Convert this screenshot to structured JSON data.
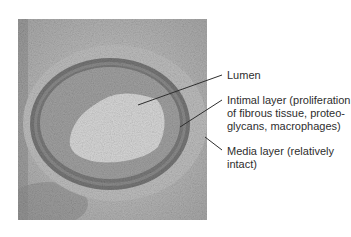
{
  "figure": {
    "type": "histology-micrograph",
    "labels": [
      {
        "id": "lumen",
        "lines": [
          "Lumen"
        ]
      },
      {
        "id": "intimal",
        "lines": [
          "Intimal layer (proliferation",
          "of fibrous tissue, proteo-",
          "glycans, macrophages)"
        ]
      },
      {
        "id": "media",
        "lines": [
          "Media layer (relatively",
          "intact)"
        ]
      }
    ],
    "colors": {
      "tissue_background": "#b4b4b4",
      "intima": "#9c9c9c",
      "media_ring": "#6e6e6e",
      "lumen": "#d8d8d8",
      "leader": "#2e2e2e",
      "text": "#2e2e2e"
    }
  }
}
